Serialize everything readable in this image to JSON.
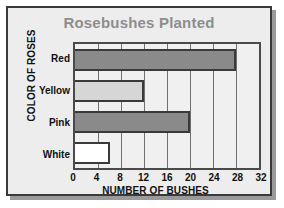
{
  "chart_data": {
    "type": "bar",
    "orientation": "horizontal",
    "title": "Rosebushes Planted",
    "xlabel": "NUMBER OF BUSHES",
    "ylabel": "COLOR OF ROSES",
    "categories": [
      "Red",
      "Yellow",
      "Pink",
      "White"
    ],
    "values": [
      28,
      12,
      20,
      6
    ],
    "xlim": [
      0,
      32
    ],
    "xticks": [
      0,
      4,
      8,
      12,
      16,
      20,
      24,
      28,
      32
    ],
    "xtick_labels": [
      "0",
      "4",
      "8",
      "12",
      "16",
      "20",
      "24",
      "28",
      "32"
    ],
    "grid": true,
    "grid_axis": "x",
    "legend": false,
    "bar_colors": [
      "#8a8a8a",
      "#d6d6d6",
      "#8a8a8a",
      "#ffffff"
    ],
    "bar_border_color": "#3a3a3a",
    "plot_background": "#f0f0f0",
    "card_background": "#ededed",
    "title_color": "#8d8d8d",
    "axis_text_color": "#111111"
  }
}
